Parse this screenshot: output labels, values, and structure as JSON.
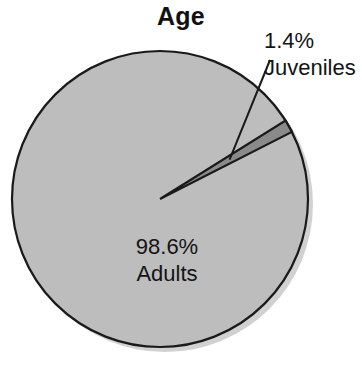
{
  "chart_data": {
    "type": "pie",
    "title": "Age",
    "xlabel": "",
    "ylabel": "",
    "legend_position": "none",
    "grid": false,
    "units": "percent",
    "categories": [
      "Adults",
      "Juveniles"
    ],
    "values": [
      98.6,
      1.4
    ],
    "slices": [
      {
        "label": "Adults",
        "value": 98.6,
        "value_text": "98.6%",
        "color": "#bdbdbd",
        "label_placement": "inside"
      },
      {
        "label": "Juveniles",
        "value": 1.4,
        "value_text": "1.4%",
        "color": "#8a8a8a",
        "label_placement": "outside-leader-line"
      }
    ],
    "annotations": [
      {
        "text": "98.6%",
        "target": "Adults"
      },
      {
        "text": "Adults",
        "target": "Adults"
      },
      {
        "text": "1.4%",
        "target": "Juveniles"
      },
      {
        "text": "Juveniles",
        "target": "Juveniles"
      }
    ]
  },
  "style": {
    "background": "#ffffff",
    "outline_color": "#1a1a1a",
    "shadow_color": "#c9c9c9",
    "title_color": "#111111",
    "label_color": "#141414"
  },
  "labels": {
    "juveniles_percent": "1.4%",
    "juveniles_name": "Juveniles",
    "adults_percent": "98.6%",
    "adults_name": "Adults"
  }
}
